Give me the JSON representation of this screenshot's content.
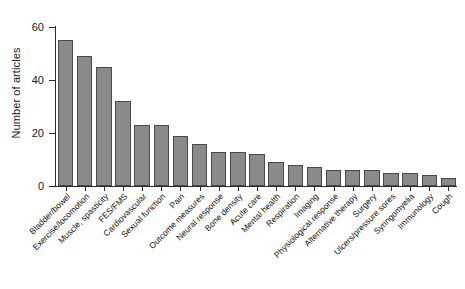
{
  "chart_data": {
    "type": "bar",
    "title": "",
    "xlabel": "",
    "ylabel": "Number of articles",
    "ylim": [
      0,
      60
    ],
    "yticks": [
      0,
      20,
      40,
      60
    ],
    "ytick_labels": [
      "0",
      "20",
      "40",
      "60"
    ],
    "grid": false,
    "legend": false,
    "bar_color": "#8a8a8a",
    "bar_edge_color": "#4a4a4a",
    "axis_color": "#2b2b2b",
    "categories": [
      "Bladder/bowel",
      "Exercise/locomotion",
      "Muscle, spasticity",
      "FES/FMS",
      "Cardiovascular",
      "Sexual function",
      "Pain",
      "Outcome measures",
      "Neural response",
      "Bone density",
      "Acute care",
      "Mental health",
      "Respiration",
      "Imaging",
      "Physiological response",
      "Alternative therapy",
      "Surgery",
      "Ulcers/pressure sores",
      "Syringomyelia",
      "Immunology",
      "Cough"
    ],
    "values": [
      55,
      49,
      45,
      32,
      23,
      23,
      19,
      16,
      13,
      13,
      12,
      9,
      8,
      7,
      6,
      6,
      6,
      5,
      5,
      4,
      3
    ]
  },
  "axes": {
    "y_title": "Number of articles"
  }
}
